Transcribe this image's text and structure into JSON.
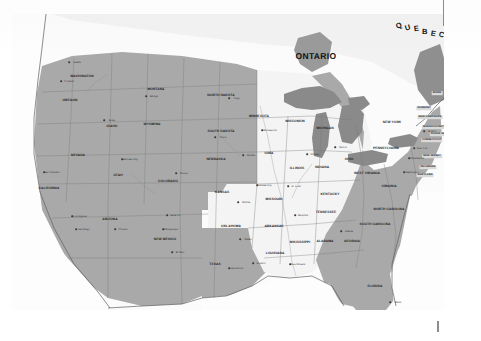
{
  "image": {
    "kind": "scanned-map",
    "subject": "United States reference map with shaded and unshaded state groups",
    "width": 481,
    "height": 341
  },
  "palette": {
    "paper": "#ffffff",
    "plate_background": "#fbfbfb",
    "shaded_state_fill": "#a9a9a9",
    "unshaded_state_fill": "#f4f4f4",
    "water_fill": "#8b8b8b",
    "great_lakes_fill": "#8a8a8a",
    "border_stroke": "#6f6f6f",
    "coast_stroke": "#5c5c5c",
    "label_text": "#1a1a1a",
    "tick_mark": "#8d8d8d"
  },
  "plate": {
    "left": 12,
    "top": 14,
    "width": 432,
    "height": 296
  },
  "marks": [
    {
      "name": "registration-tick-top",
      "label": ""
    },
    {
      "name": "registration-tick-bottom",
      "label": ""
    }
  ],
  "provinces": [
    {
      "name": "ontario",
      "label": "ONTARIO",
      "x": 316,
      "y": 56,
      "style": "province"
    },
    {
      "name": "quebec",
      "label": "QUEBEC",
      "x": 420,
      "y": 30,
      "style": "quebec"
    }
  ],
  "quebec_letters": [
    "Q",
    "U",
    "E",
    "B",
    "E",
    "C"
  ],
  "states": [
    {
      "name": "washington",
      "label": "WASHINGTON",
      "x": 82,
      "y": 76,
      "shaded": true
    },
    {
      "name": "oregon",
      "label": "OREGON",
      "x": 70,
      "y": 100,
      "shaded": true
    },
    {
      "name": "idaho",
      "label": "IDAHO",
      "x": 112,
      "y": 126,
      "shaded": true
    },
    {
      "name": "montana",
      "label": "MONTANA",
      "x": 156,
      "y": 89,
      "shaded": true
    },
    {
      "name": "wyoming",
      "label": "WYOMING",
      "x": 152,
      "y": 124,
      "shaded": true
    },
    {
      "name": "north-dakota",
      "label": "NORTH DAKOTA",
      "x": 221,
      "y": 95,
      "shaded": true
    },
    {
      "name": "south-dakota",
      "label": "SOUTH DAKOTA",
      "x": 221,
      "y": 131,
      "shaded": true
    },
    {
      "name": "nebraska",
      "label": "NEBRASKA",
      "x": 216,
      "y": 159,
      "shaded": true
    },
    {
      "name": "nevada",
      "label": "NEVADA",
      "x": 78,
      "y": 155,
      "shaded": true
    },
    {
      "name": "utah",
      "label": "UTAH",
      "x": 118,
      "y": 175,
      "shaded": true
    },
    {
      "name": "colorado",
      "label": "COLORADO",
      "x": 168,
      "y": 181,
      "shaded": true
    },
    {
      "name": "california",
      "label": "CALIFORNIA",
      "x": 49,
      "y": 188,
      "shaded": true
    },
    {
      "name": "arizona",
      "label": "ARIZONA",
      "x": 110,
      "y": 219,
      "shaded": true
    },
    {
      "name": "new-mexico",
      "label": "NEW MEXICO",
      "x": 165,
      "y": 239,
      "shaded": true
    },
    {
      "name": "texas",
      "label": "TEXAS",
      "x": 215,
      "y": 264,
      "shaded": true
    },
    {
      "name": "kansas",
      "label": "KANSAS",
      "x": 222,
      "y": 192,
      "shaded": false
    },
    {
      "name": "oklahoma",
      "label": "OKLAHOMA",
      "x": 231,
      "y": 226,
      "shaded": false
    },
    {
      "name": "minnesota",
      "label": "MINNESOTA",
      "x": 259,
      "y": 116,
      "shaded": false
    },
    {
      "name": "iowa",
      "label": "IOWA",
      "x": 269,
      "y": 153,
      "shaded": false
    },
    {
      "name": "missouri",
      "label": "MISSOURI",
      "x": 274,
      "y": 199,
      "shaded": false
    },
    {
      "name": "arkansas",
      "label": "ARKANSAS",
      "x": 274,
      "y": 226,
      "shaded": false
    },
    {
      "name": "louisiana",
      "label": "LOUISIANA",
      "x": 275,
      "y": 253,
      "shaded": false
    },
    {
      "name": "wisconsin",
      "label": "WISCONSIN",
      "x": 295,
      "y": 121,
      "shaded": true
    },
    {
      "name": "illinois",
      "label": "ILLINOIS",
      "x": 297,
      "y": 168,
      "shaded": false
    },
    {
      "name": "mississippi",
      "label": "MISSISSIPPI",
      "x": 300,
      "y": 242,
      "shaded": false
    },
    {
      "name": "michigan",
      "label": "MICHIGAN",
      "x": 325,
      "y": 128,
      "shaded": true
    },
    {
      "name": "indiana",
      "label": "INDIANA",
      "x": 322,
      "y": 167,
      "shaded": false
    },
    {
      "name": "kentucky",
      "label": "KENTUCKY",
      "x": 330,
      "y": 194,
      "shaded": false
    },
    {
      "name": "tennessee",
      "label": "TENNESSEE",
      "x": 326,
      "y": 212,
      "shaded": false
    },
    {
      "name": "alabama",
      "label": "ALABAMA",
      "x": 325,
      "y": 241,
      "shaded": false
    },
    {
      "name": "ohio",
      "label": "OHIO",
      "x": 349,
      "y": 159,
      "shaded": true
    },
    {
      "name": "west-virginia",
      "label": "WEST VIRGINIA",
      "x": 367,
      "y": 173,
      "shaded": true
    },
    {
      "name": "georgia",
      "label": "GEORGIA",
      "x": 352,
      "y": 241,
      "shaded": true
    },
    {
      "name": "florida",
      "label": "FLORIDA",
      "x": 375,
      "y": 286,
      "shaded": true
    },
    {
      "name": "south-carolina",
      "label": "SOUTH CAROLINA",
      "x": 375,
      "y": 224,
      "shaded": true
    },
    {
      "name": "north-carolina",
      "label": "NORTH CAROLINA",
      "x": 389,
      "y": 209,
      "shaded": true
    },
    {
      "name": "virginia",
      "label": "VIRGINIA",
      "x": 389,
      "y": 186,
      "shaded": true
    },
    {
      "name": "pennsylvania",
      "label": "PENNSYLVANIA",
      "x": 386,
      "y": 148,
      "shaded": true
    },
    {
      "name": "new-york",
      "label": "NEW YORK",
      "x": 392,
      "y": 122,
      "shaded": true
    }
  ],
  "eastern_small_states": [
    {
      "name": "maine",
      "label": "MAINE",
      "x": 437,
      "y": 93,
      "boxed": true
    },
    {
      "name": "vermont",
      "label": "VERMONT",
      "x": 424,
      "y": 108,
      "boxed": true
    },
    {
      "name": "new-hampshire",
      "label": "NEW HAMPSHIRE",
      "x": 430,
      "y": 117,
      "boxed": true
    },
    {
      "name": "massachusetts",
      "label": "MASSACHUSETTS",
      "x": 435,
      "y": 127,
      "boxed": true
    },
    {
      "name": "rhode-island",
      "label": "RHODE ISLAND",
      "x": 441,
      "y": 134,
      "boxed": true
    },
    {
      "name": "connecticut",
      "label": "CONNECTICUT",
      "x": 432,
      "y": 140,
      "boxed": true
    },
    {
      "name": "new-jersey",
      "label": "NEW JERSEY",
      "x": 432,
      "y": 156,
      "boxed": true
    },
    {
      "name": "delaware",
      "label": "DELAWARE",
      "x": 428,
      "y": 167,
      "boxed": true
    },
    {
      "name": "maryland",
      "label": "MARYLAND",
      "x": 425,
      "y": 175,
      "boxed": true
    }
  ],
  "cities": [
    {
      "name": "seattle",
      "label": "Seattle",
      "x": 69,
      "y": 62
    },
    {
      "name": "portland",
      "label": "Portland",
      "x": 61,
      "y": 81
    },
    {
      "name": "boise",
      "label": "Boise",
      "x": 104,
      "y": 120
    },
    {
      "name": "billings",
      "label": "Billings",
      "x": 146,
      "y": 96
    },
    {
      "name": "fargo",
      "label": "Fargo",
      "x": 229,
      "y": 98
    },
    {
      "name": "pierre",
      "label": "Pierre",
      "x": 215,
      "y": 137
    },
    {
      "name": "salt-lake-city",
      "label": "Salt Lake City",
      "x": 122,
      "y": 159
    },
    {
      "name": "denver",
      "label": "Denver",
      "x": 176,
      "y": 173
    },
    {
      "name": "san-francisco",
      "label": "San Francisco",
      "x": 44,
      "y": 172
    },
    {
      "name": "los-angeles",
      "label": "Los Angeles",
      "x": 72,
      "y": 216
    },
    {
      "name": "san-diego",
      "label": "San Diego",
      "x": 76,
      "y": 229
    },
    {
      "name": "phoenix",
      "label": "Phoenix",
      "x": 115,
      "y": 229
    },
    {
      "name": "albuquerque",
      "label": "Albuquerque",
      "x": 163,
      "y": 229
    },
    {
      "name": "santa-fe",
      "label": "Santa Fe",
      "x": 167,
      "y": 215
    },
    {
      "name": "el-paso",
      "label": "El Paso",
      "x": 172,
      "y": 252
    },
    {
      "name": "omaha",
      "label": "Omaha",
      "x": 243,
      "y": 155
    },
    {
      "name": "wichita",
      "label": "Wichita",
      "x": 238,
      "y": 202
    },
    {
      "name": "kansas-city",
      "label": "Kansas City",
      "x": 257,
      "y": 185
    },
    {
      "name": "dallas",
      "label": "Dallas",
      "x": 240,
      "y": 239
    },
    {
      "name": "houston",
      "label": "Houston",
      "x": 253,
      "y": 263
    },
    {
      "name": "san-antonio",
      "label": "San Antonio",
      "x": 229,
      "y": 268
    },
    {
      "name": "minneapolis",
      "label": "Minneapolis",
      "x": 262,
      "y": 130
    },
    {
      "name": "st-louis",
      "label": "St. Louis",
      "x": 288,
      "y": 186
    },
    {
      "name": "memphis",
      "label": "Memphis",
      "x": 295,
      "y": 215
    },
    {
      "name": "new-orleans",
      "label": "New Orleans",
      "x": 290,
      "y": 264
    },
    {
      "name": "chicago",
      "label": "Chicago",
      "x": 307,
      "y": 154
    },
    {
      "name": "detroit",
      "label": "Detroit",
      "x": 335,
      "y": 147
    },
    {
      "name": "atlanta",
      "label": "Atlanta",
      "x": 341,
      "y": 231
    },
    {
      "name": "miami",
      "label": "Miami",
      "x": 390,
      "y": 302
    },
    {
      "name": "boston",
      "label": "Boston",
      "x": 424,
      "y": 131
    },
    {
      "name": "new-york-city",
      "label": "New York",
      "x": 414,
      "y": 148
    },
    {
      "name": "philadelphia",
      "label": "Philadelphia",
      "x": 409,
      "y": 158
    },
    {
      "name": "washington-dc",
      "label": "Washington",
      "x": 404,
      "y": 172
    }
  ]
}
